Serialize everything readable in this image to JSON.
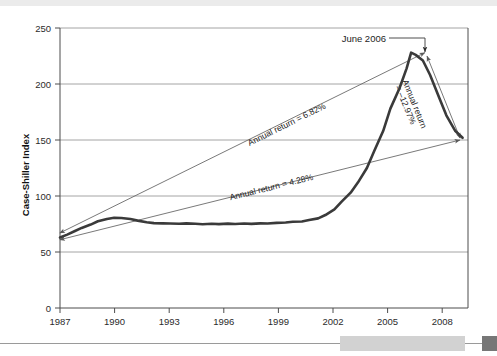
{
  "figure": {
    "top_band_color": "#ebebeb",
    "rule_color": "#9a9a9a",
    "footer_bar_color": "#d2d2d2",
    "footer_square_color": "#777777",
    "background": "#ffffff"
  },
  "chart_data": {
    "type": "line",
    "title": "",
    "subtitle": "",
    "xlabel": "",
    "ylabel": "Case-Shiller Index",
    "xlim": [
      1987,
      2009.6
    ],
    "ylim": [
      0,
      250
    ],
    "yticks": [
      0,
      50,
      100,
      150,
      200,
      250
    ],
    "ytick_labels": [
      "0",
      "50",
      "100",
      "150",
      "200",
      "250"
    ],
    "xticks": [
      1987,
      1990,
      1993,
      1996,
      1999,
      2002,
      2005,
      2008
    ],
    "xtick_labels": [
      "1987",
      "1990",
      "1993",
      "1996",
      "1999",
      "2002",
      "2005",
      "2008"
    ],
    "grid": "horizontal",
    "legend": "none",
    "line_color": "#3a3a3a",
    "line_width": 2.6,
    "series": [
      {
        "name": "Case-Shiller Index",
        "x": [
          1987.0,
          1987.4,
          1987.8,
          1988.2,
          1988.7,
          1989.1,
          1989.6,
          1990.0,
          1990.4,
          1990.9,
          1991.3,
          1991.8,
          1992.2,
          1992.7,
          1993.1,
          1993.6,
          1994.0,
          1994.5,
          1994.9,
          1995.4,
          1995.8,
          1996.3,
          1996.7,
          1997.2,
          1997.6,
          1998.1,
          1998.5,
          1999.0,
          1999.5,
          1999.9,
          2000.4,
          2000.8,
          2001.3,
          2001.7,
          2002.2,
          2002.6,
          2003.1,
          2003.5,
          2004.0,
          2004.4,
          2004.9,
          2005.3,
          2005.8,
          2006.2,
          2006.45,
          2006.7,
          2007.1,
          2007.5,
          2008.0,
          2008.4,
          2008.9,
          2009.3
        ],
        "y": [
          63.0,
          65.5,
          68.5,
          71.5,
          74.5,
          77.5,
          79.5,
          80.5,
          80.3,
          79.4,
          78.0,
          76.6,
          75.8,
          75.6,
          75.4,
          75.2,
          75.6,
          75.2,
          74.8,
          75.2,
          74.9,
          75.3,
          75.0,
          75.4,
          75.1,
          75.6,
          75.4,
          76.0,
          76.4,
          77.0,
          77.2,
          78.5,
          80.0,
          83.0,
          88.0,
          95.0,
          103.0,
          112.0,
          125.0,
          140.0,
          158.0,
          178.0,
          196.0,
          214.0,
          228.0,
          226.0,
          221.0,
          208.0,
          188.0,
          172.0,
          158.0,
          152.0
        ]
      }
    ],
    "annotations": [
      {
        "name": "upper-trend-arrow",
        "label": "Annual return = 6.82%",
        "value": 6.82,
        "from": {
          "x": 1987.0,
          "y": 67.0
        },
        "to": {
          "x": 2006.45,
          "y": 228.0
        },
        "style": "double-arrow"
      },
      {
        "name": "lower-trend-arrow",
        "label": "Annual return = 4.28%",
        "value": 4.28,
        "from": {
          "x": 1987.0,
          "y": 61.0
        },
        "to": {
          "x": 2009.3,
          "y": 150.0
        },
        "style": "double-arrow"
      },
      {
        "name": "decline-arrow",
        "label": "Annual return = –12.97%",
        "value": -12.97,
        "from": {
          "x": 2009.3,
          "y": 152.0
        },
        "to": {
          "x": 2006.45,
          "y": 228.0
        },
        "style": "double-arrow"
      },
      {
        "name": "peak-callout",
        "label": "June 2006",
        "point": {
          "x": 2006.45,
          "y": 228.0
        }
      }
    ]
  },
  "axes": {
    "y_axis_title": "Case-Shiller Index",
    "y_tick_0": "0",
    "y_tick_50": "50",
    "y_tick_100": "100",
    "y_tick_150": "150",
    "y_tick_200": "200",
    "y_tick_250": "250",
    "x_tick_1987": "1987",
    "x_tick_1990": "1990",
    "x_tick_1993": "1993",
    "x_tick_1996": "1996",
    "x_tick_1999": "1999",
    "x_tick_2002": "2002",
    "x_tick_2005": "2005",
    "x_tick_2008": "2008"
  },
  "labels": {
    "upper_return": "Annual return = 6.82%",
    "lower_return": "Annual return = 4.28%",
    "decline_return_line1": "Annual return",
    "decline_return_line2": "= –12.97%",
    "peak_callout": "June 2006"
  }
}
